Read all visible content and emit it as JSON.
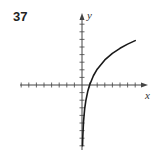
{
  "problem": {
    "number": "37"
  },
  "chart_data": {
    "type": "line",
    "title": "",
    "xlabel": "x",
    "ylabel": "y",
    "function_description": "logarithmic curve y ≈ 3·ln(x), vertical asymptote at x = 0, x-intercept at x = 1",
    "xlim": [
      -8,
      8
    ],
    "ylim": [
      -8,
      9
    ],
    "grid": false,
    "tick_spacing": 1,
    "tick_labels": [],
    "series": [
      {
        "name": "curve",
        "x": [
          0.07,
          0.1,
          0.2,
          0.35,
          0.5,
          0.75,
          1,
          1.5,
          2,
          3,
          4,
          5,
          6,
          7
        ],
        "y": [
          -7.98,
          -6.91,
          -4.83,
          -3.15,
          -2.08,
          -0.86,
          0,
          1.22,
          2.08,
          3.3,
          4.16,
          4.83,
          5.38,
          5.84
        ]
      }
    ],
    "colors": {
      "curve": "#1a1a1a",
      "axes": "#444444"
    }
  }
}
